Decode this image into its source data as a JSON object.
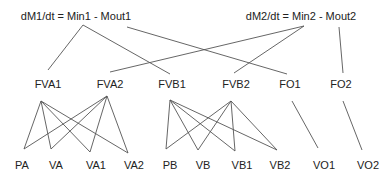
{
  "equations": [
    {
      "id": "eq1",
      "text": "dM1/dt = Min1 - Mout1",
      "x": 76,
      "y": 10
    },
    {
      "id": "eq2",
      "text": "dM2/dt = Min2 - Mout2",
      "x": 301,
      "y": 10
    }
  ],
  "level2": [
    {
      "id": "FVA1",
      "text": "FVA1",
      "x": 48,
      "y": 78
    },
    {
      "id": "FVA2",
      "text": "FVA2",
      "x": 110,
      "y": 78
    },
    {
      "id": "FVB1",
      "text": "FVB1",
      "x": 172,
      "y": 78
    },
    {
      "id": "FVB2",
      "text": "FVB2",
      "x": 236,
      "y": 78
    },
    {
      "id": "FO1",
      "text": "FO1",
      "x": 290,
      "y": 78
    },
    {
      "id": "FO2",
      "text": "FO2",
      "x": 341,
      "y": 78
    }
  ],
  "level3": [
    {
      "id": "PA",
      "text": "PA",
      "x": 22,
      "y": 159
    },
    {
      "id": "VA",
      "text": "VA",
      "x": 56,
      "y": 159
    },
    {
      "id": "VA1",
      "text": "VA1",
      "x": 96,
      "y": 159
    },
    {
      "id": "VA2",
      "text": "VA2",
      "x": 134,
      "y": 159
    },
    {
      "id": "PB",
      "text": "PB",
      "x": 170,
      "y": 159
    },
    {
      "id": "VB",
      "text": "VB",
      "x": 203,
      "y": 159
    },
    {
      "id": "VB1",
      "text": "VB1",
      "x": 242,
      "y": 159
    },
    {
      "id": "VB2",
      "text": "VB2",
      "x": 280,
      "y": 159
    },
    {
      "id": "VO1",
      "text": "VO1",
      "x": 324,
      "y": 159
    },
    {
      "id": "VO2",
      "text": "VO2",
      "x": 368,
      "y": 159
    }
  ],
  "edges": [
    {
      "x1": 83,
      "y1": 25,
      "x2": 48,
      "y2": 70
    },
    {
      "x1": 83,
      "y1": 25,
      "x2": 170,
      "y2": 74
    },
    {
      "x1": 127,
      "y1": 27,
      "x2": 287,
      "y2": 74
    },
    {
      "x1": 304,
      "y1": 26,
      "x2": 110,
      "y2": 72
    },
    {
      "x1": 304,
      "y1": 26,
      "x2": 234,
      "y2": 73
    },
    {
      "x1": 339,
      "y1": 27,
      "x2": 343,
      "y2": 73
    },
    {
      "x1": 41,
      "y1": 101,
      "x2": 24,
      "y2": 149
    },
    {
      "x1": 41,
      "y1": 101,
      "x2": 51,
      "y2": 149
    },
    {
      "x1": 41,
      "y1": 101,
      "x2": 90,
      "y2": 152
    },
    {
      "x1": 41,
      "y1": 101,
      "x2": 128,
      "y2": 153
    },
    {
      "x1": 107,
      "y1": 96,
      "x2": 24,
      "y2": 149
    },
    {
      "x1": 107,
      "y1": 96,
      "x2": 51,
      "y2": 149
    },
    {
      "x1": 107,
      "y1": 96,
      "x2": 90,
      "y2": 152
    },
    {
      "x1": 107,
      "y1": 96,
      "x2": 128,
      "y2": 153
    },
    {
      "x1": 170,
      "y1": 100,
      "x2": 166,
      "y2": 149
    },
    {
      "x1": 170,
      "y1": 100,
      "x2": 198,
      "y2": 150
    },
    {
      "x1": 170,
      "y1": 100,
      "x2": 235,
      "y2": 151
    },
    {
      "x1": 170,
      "y1": 100,
      "x2": 277,
      "y2": 150
    },
    {
      "x1": 231,
      "y1": 101,
      "x2": 166,
      "y2": 149
    },
    {
      "x1": 231,
      "y1": 101,
      "x2": 198,
      "y2": 150
    },
    {
      "x1": 231,
      "y1": 101,
      "x2": 235,
      "y2": 151
    },
    {
      "x1": 231,
      "y1": 101,
      "x2": 277,
      "y2": 150
    },
    {
      "x1": 292,
      "y1": 101,
      "x2": 318,
      "y2": 148
    },
    {
      "x1": 343,
      "y1": 101,
      "x2": 362,
      "y2": 150
    }
  ],
  "style": {
    "line_color": "#555555",
    "text_color": "#222222"
  }
}
